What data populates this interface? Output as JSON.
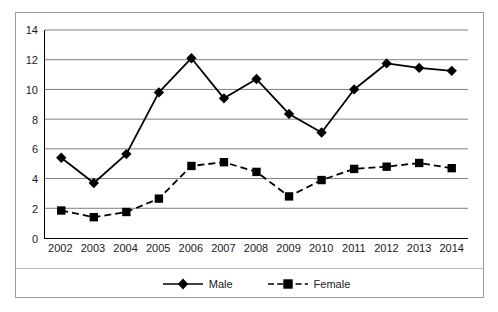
{
  "chart_data": {
    "type": "line",
    "title": "",
    "xlabel": "",
    "ylabel": "",
    "categories": [
      "2002",
      "2003",
      "2004",
      "2005",
      "2006",
      "2007",
      "2008",
      "2009",
      "2010",
      "2011",
      "2012",
      "2013",
      "2014"
    ],
    "ylim": [
      0,
      14
    ],
    "ytick_values": [
      0,
      2,
      4,
      6,
      8,
      10,
      12,
      14
    ],
    "ytick_labels": [
      "0",
      "2",
      "4",
      "6",
      "8",
      "10",
      "12",
      "14"
    ],
    "grid": "horizontal",
    "legend_position": "bottom",
    "series": [
      {
        "name": "Male",
        "marker": "diamond",
        "linestyle": "solid",
        "color": "#000000",
        "values": [
          5.4,
          3.7,
          5.65,
          9.8,
          12.1,
          9.4,
          10.7,
          8.35,
          7.1,
          10.0,
          11.75,
          11.45,
          11.25
        ]
      },
      {
        "name": "Female",
        "marker": "square",
        "linestyle": "dashed",
        "color": "#000000",
        "values": [
          1.85,
          1.4,
          1.75,
          2.65,
          4.85,
          5.1,
          4.45,
          2.8,
          3.9,
          4.65,
          4.8,
          5.05,
          4.7
        ]
      }
    ]
  },
  "legend": {
    "items": [
      {
        "label": "Male"
      },
      {
        "label": "Female"
      }
    ]
  },
  "colors": {
    "series": "#000000",
    "gridline": "#808080",
    "axis": "#000000",
    "border": "#9a9a9a",
    "background": "#ffffff"
  }
}
